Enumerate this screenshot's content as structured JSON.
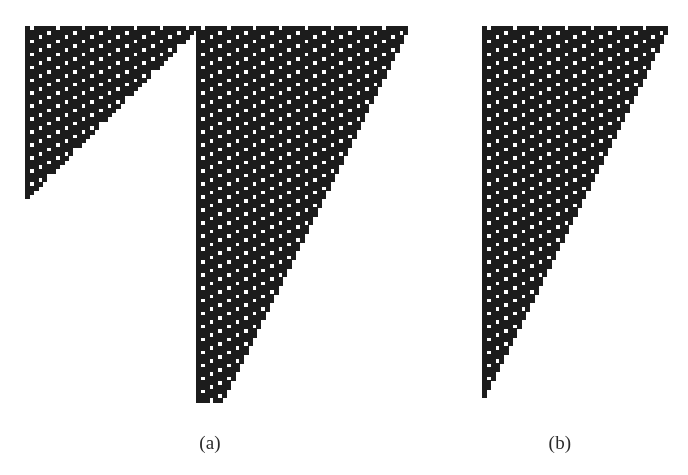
{
  "figure": {
    "type": "cellular-automaton-evolution",
    "background_color": "#ffffff",
    "cell_color": "#1c1c1c",
    "canvas_width": 688,
    "canvas_height": 475,
    "cell_size": 4.32
  },
  "panels": [
    {
      "id": "panel-a",
      "caption": "(a)",
      "caption_x": 210,
      "caption_y": 450,
      "regions": [
        {
          "name": "left-triangle",
          "origin_x": 25,
          "origin_y": 26,
          "width_px": 172,
          "height_px": 205,
          "columns": 40,
          "rows": 48,
          "shape": "upper-left-triangle",
          "hypotenuse": "descends-left",
          "seed": "full-row"
        },
        {
          "name": "right-wedge",
          "origin_x": 196,
          "origin_y": 26,
          "width_px": 210,
          "height_px": 375,
          "columns": 49,
          "rows": 87,
          "shape": "left-edge-vertical-right-edge-diagonal",
          "hypotenuse": "descends-left",
          "seed": "full-row"
        }
      ]
    },
    {
      "id": "panel-b",
      "caption": "(b)",
      "caption_x": 560,
      "caption_y": 450,
      "regions": [
        {
          "name": "main-wedge",
          "origin_x": 482,
          "origin_y": 26,
          "width_px": 186,
          "height_px": 375,
          "columns": 43,
          "rows": 87,
          "shape": "left-edge-vertical-right-edge-diagonal",
          "hypotenuse": "descends-left",
          "seed": "full-row"
        }
      ]
    }
  ],
  "chart_data": {
    "type": "heatmap",
    "title": "",
    "xlabel": "",
    "ylabel": "",
    "rule": "diagonal-stripe-automaton",
    "rule_description": "Cell (r,c) is black unless (r + c) mod 3 == 0 and (r mod 2 + c mod 2) pattern selects a white hole; produces bands of white squares along down-right diagonals separated by black.",
    "stripe_period": 3,
    "stripe_direction": "down-right",
    "legend": [
      {
        "label": "alive cell",
        "color": "#1c1c1c"
      },
      {
        "label": "dead cell",
        "color": "#ffffff"
      }
    ],
    "axis_ranges": {
      "x": [
        0,
        688
      ],
      "y": [
        0,
        475
      ]
    },
    "grid": false,
    "legend_position": "none",
    "annotations": [
      "(a)",
      "(b)"
    ]
  },
  "captions": {
    "a": "(a)",
    "b": "(b)"
  }
}
